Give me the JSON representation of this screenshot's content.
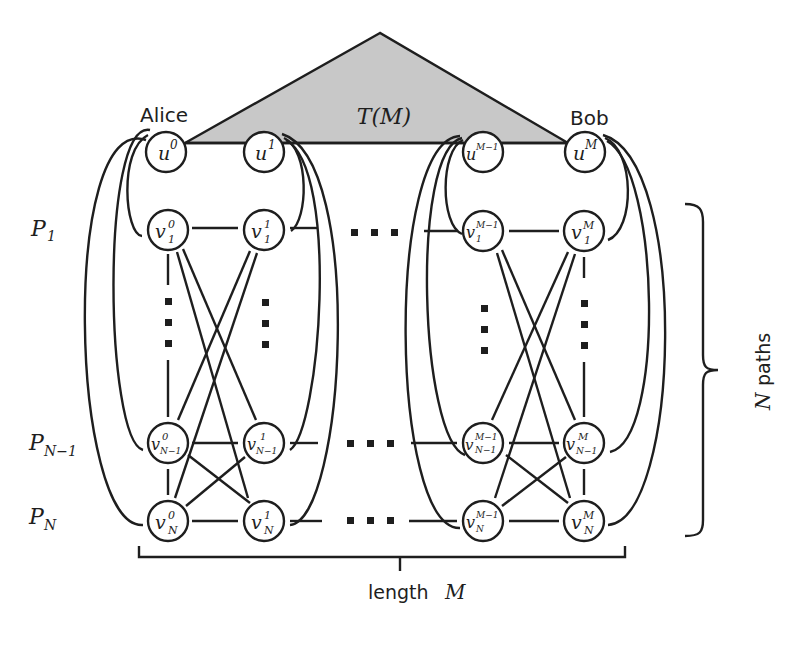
{
  "figure": {
    "tree_label": "T(M)",
    "alice_label": "Alice",
    "bob_label": "Bob",
    "length_label_text": "length",
    "length_label_var": "M",
    "paths_label_var": "N",
    "paths_label_text": "paths"
  },
  "path_labels": [
    {
      "base": "P",
      "sub": "1"
    },
    {
      "base": "P",
      "sub": "N−1"
    },
    {
      "base": "P",
      "sub": "N"
    }
  ],
  "nodes": {
    "u0": {
      "base": "u",
      "sup": "0",
      "sub": ""
    },
    "u1": {
      "base": "u",
      "sup": "1",
      "sub": ""
    },
    "uM1": {
      "base": "u",
      "sup": "M−1",
      "sub": ""
    },
    "uM": {
      "base": "u",
      "sup": "M",
      "sub": ""
    },
    "v10": {
      "base": "v",
      "sup": "0",
      "sub": "1"
    },
    "v11": {
      "base": "v",
      "sup": "1",
      "sub": "1"
    },
    "v1M1": {
      "base": "v",
      "sup": "M−1",
      "sub": "1"
    },
    "v1M": {
      "base": "v",
      "sup": "M",
      "sub": "1"
    },
    "vN10": {
      "base": "v",
      "sup": "0",
      "sub": "N−1"
    },
    "vN11": {
      "base": "v",
      "sup": "1",
      "sub": "N−1"
    },
    "vN1M1": {
      "base": "v",
      "sup": "M−1",
      "sub": "N−1"
    },
    "vN1M": {
      "base": "v",
      "sup": "M",
      "sub": "N−1"
    },
    "vN0": {
      "base": "v",
      "sup": "0",
      "sub": "N"
    },
    "vN1": {
      "base": "v",
      "sup": "1",
      "sub": "N"
    },
    "vNM1": {
      "base": "v",
      "sup": "M−1",
      "sub": "N"
    },
    "vNM": {
      "base": "v",
      "sup": "M",
      "sub": "N"
    }
  },
  "colors": {
    "stroke": "#1e1e1e",
    "tree_fill": "#c8c8c8",
    "background": "#ffffff"
  }
}
